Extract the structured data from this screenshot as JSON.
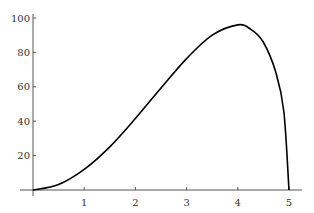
{
  "chart_data": {
    "type": "line",
    "title": "",
    "xlabel": "",
    "ylabel": "",
    "xlim": [
      0,
      5
    ],
    "ylim": [
      0,
      100
    ],
    "grid": false,
    "legend": null,
    "x_ticks": [
      "1",
      "2",
      "3",
      "4",
      "5"
    ],
    "y_ticks": [
      "20",
      "40",
      "60",
      "80",
      "100"
    ],
    "series": [
      {
        "name": "curve",
        "color": "#000000",
        "x": [
          0,
          0.5,
          1,
          1.5,
          2,
          2.5,
          3,
          3.5,
          4,
          4.25,
          4.5,
          4.75,
          4.9,
          5
        ],
        "y": [
          0,
          3.2,
          12.0,
          25.1,
          41.6,
          59.3,
          76.4,
          90.0,
          96.0,
          93.5,
          85.9,
          67.7,
          45.5,
          0
        ]
      }
    ]
  }
}
